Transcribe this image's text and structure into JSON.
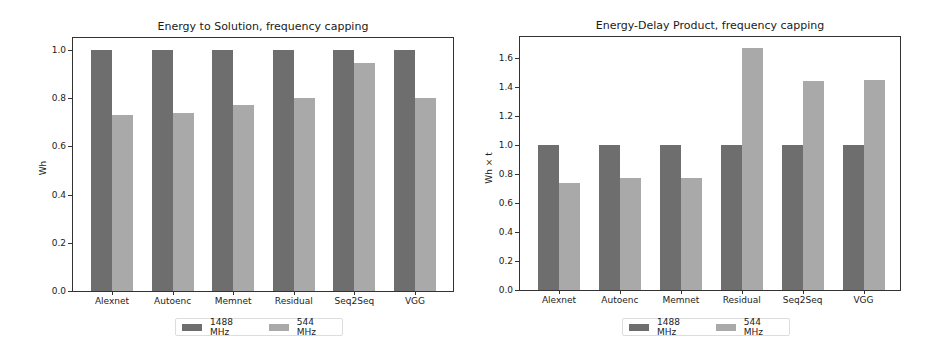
{
  "colors": {
    "series_1488": "#6e6e6e",
    "series_544": "#a9a9a9"
  },
  "chart_data": [
    {
      "type": "bar",
      "title": "Energy to Solution, frequency capping",
      "xlabel": "",
      "ylabel": "Wh",
      "ylim": [
        0,
        1.05
      ],
      "yticks": [
        "0.0",
        "0.2",
        "0.4",
        "0.6",
        "0.8",
        "1.0"
      ],
      "categories": [
        "Alexnet",
        "Autoenc",
        "Memnet",
        "Residual",
        "Seq2Seq",
        "VGG"
      ],
      "series": [
        {
          "name": "1488 MHz",
          "values": [
            1.0,
            1.0,
            1.0,
            1.0,
            1.0,
            1.0
          ]
        },
        {
          "name": "544 MHz",
          "values": [
            0.73,
            0.74,
            0.77,
            0.8,
            0.945,
            0.8
          ]
        }
      ],
      "grid": false,
      "legend_position": "below"
    },
    {
      "type": "bar",
      "title": "Energy-Delay Product, frequency capping",
      "xlabel": "",
      "ylabel": "Wh × t",
      "ylim": [
        0,
        1.75
      ],
      "yticks": [
        "0.0",
        "0.2",
        "0.4",
        "0.6",
        "0.8",
        "1.0",
        "1.2",
        "1.4",
        "1.6"
      ],
      "categories": [
        "Alexnet",
        "Autoenc",
        "Memnet",
        "Residual",
        "Seq2Seq",
        "VGG"
      ],
      "series": [
        {
          "name": "1488 MHz",
          "values": [
            1.0,
            1.0,
            1.0,
            1.0,
            1.0,
            1.0
          ]
        },
        {
          "name": "544 MHz",
          "values": [
            0.74,
            0.77,
            0.77,
            1.67,
            1.44,
            1.45
          ]
        }
      ],
      "grid": false,
      "legend_position": "below"
    }
  ]
}
